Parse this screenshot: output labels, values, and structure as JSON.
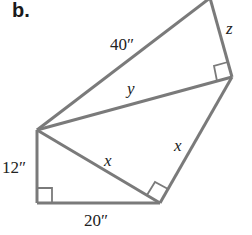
{
  "part_label": "b.",
  "colors": {
    "stroke": "#7a7a7a",
    "text": "#222222"
  },
  "labels": {
    "hyp_top": "40″",
    "z": "z",
    "y": "y",
    "x_inner": "x",
    "x_outer": "x",
    "left_leg": "12″",
    "bottom_leg": "20″"
  },
  "vertices": {
    "top": [
      210,
      -2
    ],
    "upper_right": [
      232,
      77
    ],
    "left": [
      37,
      130
    ],
    "bottom_left": [
      37,
      203
    ],
    "bottom_right": [
      160,
      203
    ]
  }
}
